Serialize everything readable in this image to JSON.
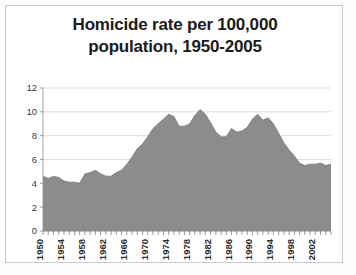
{
  "chart_data": {
    "type": "area",
    "title": "Homicide rate per 100,000 population, 1950-2005",
    "title_line1": "Homicide rate per 100,000",
    "title_line2": "population, 1950-2005",
    "xlabel": "",
    "ylabel": "",
    "ylim": [
      0,
      12
    ],
    "xlim": [
      1950,
      2005
    ],
    "yticks": [
      0,
      2,
      4,
      6,
      8,
      10,
      12
    ],
    "xticks": [
      1950,
      1954,
      1958,
      1962,
      1966,
      1970,
      1974,
      1978,
      1982,
      1986,
      1990,
      1994,
      1998,
      2002
    ],
    "xtick_rotation": 90,
    "grid": true,
    "legend": false,
    "series_color": "#8c8c8c",
    "x": [
      1950,
      1951,
      1952,
      1953,
      1954,
      1955,
      1956,
      1957,
      1958,
      1959,
      1960,
      1961,
      1962,
      1963,
      1964,
      1965,
      1966,
      1967,
      1968,
      1969,
      1970,
      1971,
      1972,
      1973,
      1974,
      1975,
      1976,
      1977,
      1978,
      1979,
      1980,
      1981,
      1982,
      1983,
      1984,
      1985,
      1986,
      1987,
      1988,
      1989,
      1990,
      1991,
      1992,
      1993,
      1994,
      1995,
      1996,
      1997,
      1998,
      1999,
      2000,
      2001,
      2002,
      2003,
      2004,
      2005
    ],
    "values": [
      4.6,
      4.4,
      4.6,
      4.5,
      4.2,
      4.1,
      4.1,
      4.0,
      4.8,
      4.9,
      5.1,
      4.8,
      4.6,
      4.6,
      4.9,
      5.1,
      5.6,
      6.2,
      6.9,
      7.3,
      7.9,
      8.6,
      9.0,
      9.4,
      9.8,
      9.6,
      8.8,
      8.8,
      9.0,
      9.7,
      10.2,
      9.8,
      9.1,
      8.3,
      7.9,
      7.9,
      8.6,
      8.3,
      8.4,
      8.7,
      9.4,
      9.8,
      9.3,
      9.5,
      9.0,
      8.2,
      7.4,
      6.8,
      6.3,
      5.7,
      5.5,
      5.6,
      5.6,
      5.7,
      5.5,
      5.6
    ]
  }
}
